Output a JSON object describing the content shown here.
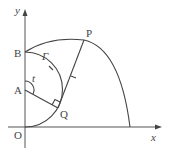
{
  "diagram": {
    "axes": {
      "x_label": "x",
      "y_label": "y",
      "origin_label": "O"
    },
    "points": {
      "A": "A",
      "B": "B",
      "P": "P",
      "Q": "Q"
    },
    "curve_label": "Γ",
    "angle_label": "t",
    "colors": {
      "line": "#444444",
      "background": "#ffffff"
    }
  }
}
